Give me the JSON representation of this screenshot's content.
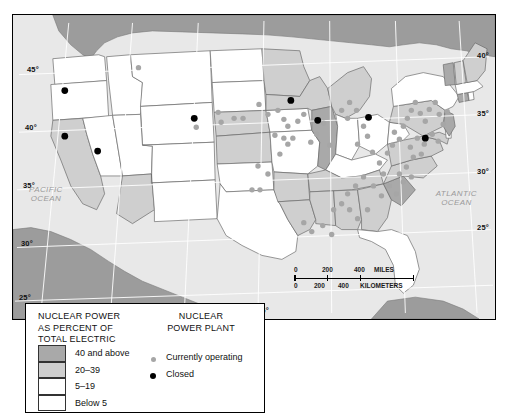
{
  "map": {
    "title": "Nuclear Power as Percent of Total Electric",
    "projection_note": "Conterminous United States",
    "lat_labels": [
      "45°",
      "40°",
      "35°",
      "30°",
      "25°"
    ],
    "lon_labels": [
      "95°",
      "90°",
      "85°"
    ],
    "ocean_labels": [
      {
        "name": "pacific-ocean-label",
        "line1": "PACIFIC",
        "line2": "OCEAN"
      },
      {
        "name": "atlantic-ocean-label",
        "line1": "ATLANTIC",
        "line2": "OCEAN"
      }
    ],
    "colors": {
      "class_40_and_above": "#a9a9a9",
      "class_20_39": "#cfcfcf",
      "class_5_19": "#ffffff",
      "class_below_5": "#ffffff",
      "ocean": "#e8e8e8",
      "neighbor_land": "#9c9c9c",
      "operating_dot": "#a6a6a6",
      "closed_dot": "#000000",
      "border": "#000000"
    }
  },
  "scale": {
    "miles_ticks": [
      "0",
      "200",
      "400"
    ],
    "miles_unit": "MILES",
    "km_ticks": [
      "0",
      "200",
      "400"
    ],
    "km_unit": "KILOMETERS"
  },
  "legend": {
    "title_lines": [
      "NUCLEAR POWER",
      "AS PERCENT OF",
      "TOTAL ELECTRIC"
    ],
    "classes": [
      {
        "label": "40 and above",
        "color": "#a9a9a9"
      },
      {
        "label": "20–39",
        "color": "#cfcfcf"
      },
      {
        "label": "5–19",
        "color": "#ffffff"
      },
      {
        "label": "Below 5",
        "color": "#ffffff"
      }
    ],
    "plant_title_lines": [
      "NUCLEAR",
      "POWER PLANT"
    ],
    "plant_keys": [
      {
        "label": "Currently operating",
        "color": "#a6a6a6",
        "size": 5
      },
      {
        "label": "Closed",
        "color": "#000000",
        "size": 6
      }
    ]
  },
  "chart_data": {
    "type": "choropleth-map",
    "title": "Nuclear Power as Percent of Total Electric",
    "legend_position": "bottom-left",
    "value_classes": [
      "40 and above",
      "20-39",
      "5-19",
      "Below 5"
    ],
    "states": [
      {
        "name": "Washington",
        "class": "5-19"
      },
      {
        "name": "Oregon",
        "class": "Below 5"
      },
      {
        "name": "California",
        "class": "20-39"
      },
      {
        "name": "Nevada",
        "class": "Below 5"
      },
      {
        "name": "Idaho",
        "class": "Below 5"
      },
      {
        "name": "Montana",
        "class": "Below 5"
      },
      {
        "name": "Wyoming",
        "class": "Below 5"
      },
      {
        "name": "Utah",
        "class": "Below 5"
      },
      {
        "name": "Arizona",
        "class": "20-39"
      },
      {
        "name": "Colorado",
        "class": "Below 5"
      },
      {
        "name": "New Mexico",
        "class": "Below 5"
      },
      {
        "name": "North Dakota",
        "class": "Below 5"
      },
      {
        "name": "South Dakota",
        "class": "Below 5"
      },
      {
        "name": "Nebraska",
        "class": "20-39"
      },
      {
        "name": "Kansas",
        "class": "20-39"
      },
      {
        "name": "Oklahoma",
        "class": "Below 5"
      },
      {
        "name": "Texas",
        "class": "Below 5"
      },
      {
        "name": "Minnesota",
        "class": "20-39"
      },
      {
        "name": "Iowa",
        "class": "5-19"
      },
      {
        "name": "Missouri",
        "class": "5-19"
      },
      {
        "name": "Arkansas",
        "class": "20-39"
      },
      {
        "name": "Louisiana",
        "class": "20-39"
      },
      {
        "name": "Wisconsin",
        "class": "20-39"
      },
      {
        "name": "Illinois",
        "class": "40 and above"
      },
      {
        "name": "Michigan",
        "class": "20-39"
      },
      {
        "name": "Indiana",
        "class": "Below 5"
      },
      {
        "name": "Ohio",
        "class": "5-19"
      },
      {
        "name": "Kentucky",
        "class": "Below 5"
      },
      {
        "name": "Tennessee",
        "class": "20-39"
      },
      {
        "name": "Mississippi",
        "class": "20-39"
      },
      {
        "name": "Alabama",
        "class": "20-39"
      },
      {
        "name": "Georgia",
        "class": "20-39"
      },
      {
        "name": "Florida",
        "class": "5-19"
      },
      {
        "name": "South Carolina",
        "class": "40 and above"
      },
      {
        "name": "North Carolina",
        "class": "20-39"
      },
      {
        "name": "Virginia",
        "class": "20-39"
      },
      {
        "name": "West Virginia",
        "class": "Below 5"
      },
      {
        "name": "Maryland",
        "class": "20-39"
      },
      {
        "name": "Delaware",
        "class": "Below 5"
      },
      {
        "name": "Pennsylvania",
        "class": "20-39"
      },
      {
        "name": "New Jersey",
        "class": "40 and above"
      },
      {
        "name": "New York",
        "class": "5-19"
      },
      {
        "name": "Connecticut",
        "class": "40 and above"
      },
      {
        "name": "Rhode Island",
        "class": "Below 5"
      },
      {
        "name": "Massachusetts",
        "class": "5-19"
      },
      {
        "name": "Vermont",
        "class": "40 and above"
      },
      {
        "name": "New Hampshire",
        "class": "20-39"
      },
      {
        "name": "Maine",
        "class": "20-39"
      }
    ],
    "point_series": [
      {
        "name": "Currently operating",
        "color": "#a6a6a6",
        "count": 78,
        "points": [
          [
            126,
            53
          ],
          [
            184,
            113
          ],
          [
            206,
            98
          ],
          [
            209,
            108
          ],
          [
            222,
            104
          ],
          [
            231,
            104
          ],
          [
            247,
            90
          ],
          [
            256,
            100
          ],
          [
            266,
            96
          ],
          [
            272,
            105
          ],
          [
            276,
            112
          ],
          [
            286,
            107
          ],
          [
            292,
            100
          ],
          [
            263,
            121
          ],
          [
            272,
            124
          ],
          [
            276,
            130
          ],
          [
            281,
            124
          ],
          [
            268,
            140
          ],
          [
            256,
            160
          ],
          [
            246,
            152
          ],
          [
            299,
            128
          ],
          [
            305,
            120
          ],
          [
            312,
            109
          ],
          [
            318,
            131
          ],
          [
            330,
            96
          ],
          [
            336,
            104
          ],
          [
            338,
            88
          ],
          [
            345,
            96
          ],
          [
            352,
            112
          ],
          [
            346,
            130
          ],
          [
            356,
            122
          ],
          [
            361,
            138
          ],
          [
            368,
            149
          ],
          [
            372,
            160
          ],
          [
            376,
            139
          ],
          [
            381,
            131
          ],
          [
            383,
            118
          ],
          [
            388,
            125
          ],
          [
            392,
            112
          ],
          [
            396,
            104
          ],
          [
            400,
            96
          ],
          [
            404,
            88
          ],
          [
            409,
            99
          ],
          [
            414,
            107
          ],
          [
            418,
            95
          ],
          [
            424,
            88
          ],
          [
            428,
            100
          ],
          [
            432,
            110
          ],
          [
            436,
            97
          ],
          [
            421,
            120
          ],
          [
            427,
            127
          ],
          [
            413,
            130
          ],
          [
            406,
            124
          ],
          [
            399,
            133
          ],
          [
            402,
            143
          ],
          [
            410,
            140
          ],
          [
            395,
            153
          ],
          [
            388,
            160
          ],
          [
            392,
            168
          ],
          [
            400,
            163
          ],
          [
            378,
            172
          ],
          [
            385,
            180
          ],
          [
            370,
            182
          ],
          [
            362,
            172
          ],
          [
            352,
            163
          ],
          [
            344,
            172
          ],
          [
            336,
            180
          ],
          [
            330,
            190
          ],
          [
            322,
            196
          ],
          [
            338,
            196
          ],
          [
            346,
            205
          ],
          [
            356,
            196
          ],
          [
            311,
            212
          ],
          [
            320,
            221
          ],
          [
            292,
            209
          ],
          [
            300,
            218
          ],
          [
            240,
            176
          ],
          [
            248,
            176
          ]
        ]
      },
      {
        "name": "Closed",
        "color": "#000000",
        "count": 8,
        "points": [
          [
            52,
            76
          ],
          [
            52,
            122
          ],
          [
            85,
            137
          ],
          [
            182,
            104
          ],
          [
            279,
            86
          ],
          [
            306,
            106
          ],
          [
            357,
            103
          ],
          [
            414,
            124
          ]
        ]
      }
    ]
  }
}
